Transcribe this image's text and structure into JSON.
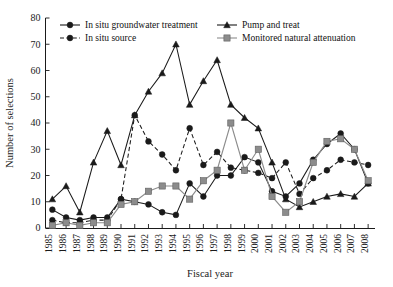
{
  "chart_data": {
    "type": "line",
    "title": "",
    "xlabel": "Fiscal year",
    "ylabel": "Number of selections",
    "xlim": [
      1985,
      2008
    ],
    "ylim": [
      0,
      80
    ],
    "ytick_step": 10,
    "yticks": [
      0,
      10,
      20,
      30,
      40,
      50,
      60,
      70,
      80
    ],
    "grid": false,
    "legend_position": "top-inside",
    "categories": [
      "1985",
      "1986",
      "1987",
      "1988",
      "1989",
      "1990",
      "1991",
      "1992",
      "1993",
      "1994",
      "1995",
      "1996",
      "1997",
      "1998",
      "1999",
      "2000",
      "2001",
      "2002",
      "2003",
      "2004",
      "2005",
      "2006",
      "2007",
      "2008"
    ],
    "series": [
      {
        "name": "In situ groundwater treatment",
        "marker": "circle",
        "line_style": "solid",
        "color": "#1a1a1a",
        "values": [
          7,
          4,
          3,
          4,
          4,
          11,
          10,
          9,
          6,
          5,
          17,
          12,
          20,
          20,
          27,
          25,
          14,
          12,
          17,
          26,
          32,
          36,
          30,
          17
        ]
      },
      {
        "name": "In situ source",
        "marker": "circle",
        "line_style": "dashed",
        "color": "#1a1a1a",
        "values": [
          3,
          2,
          2,
          3,
          3,
          11,
          43,
          33,
          28,
          22,
          38,
          24,
          29,
          23,
          22,
          21,
          19,
          25,
          13,
          19,
          22,
          26,
          25,
          24
        ]
      },
      {
        "name": "Pump and treat",
        "marker": "triangle",
        "line_style": "solid",
        "color": "#1a1a1a",
        "values": [
          11,
          16,
          6,
          25,
          37,
          24,
          43,
          52,
          59,
          70,
          47,
          56,
          64,
          47,
          42,
          38,
          25,
          11,
          8,
          10,
          12,
          13,
          12,
          17
        ]
      },
      {
        "name": "Monitored natural attenuation",
        "marker": "square",
        "line_style": "solid",
        "color": "#8c8c8c",
        "values": [
          1,
          2,
          1,
          2,
          2,
          9,
          10,
          14,
          16,
          16,
          11,
          18,
          22,
          40,
          22,
          30,
          12,
          6,
          10,
          25,
          33,
          34,
          30,
          18
        ]
      }
    ]
  },
  "legend": {
    "entries": [
      {
        "label": "In situ groundwater treatment",
        "marker": "circle",
        "line_style": "solid",
        "color": "#1a1a1a"
      },
      {
        "label": "Pump and treat",
        "marker": "triangle",
        "line_style": "solid",
        "color": "#1a1a1a"
      },
      {
        "label": "In situ source",
        "marker": "circle",
        "line_style": "dashed",
        "color": "#1a1a1a"
      },
      {
        "label": "Monitored natural attenuation",
        "marker": "square",
        "line_style": "solid",
        "color": "#8c8c8c"
      }
    ]
  }
}
